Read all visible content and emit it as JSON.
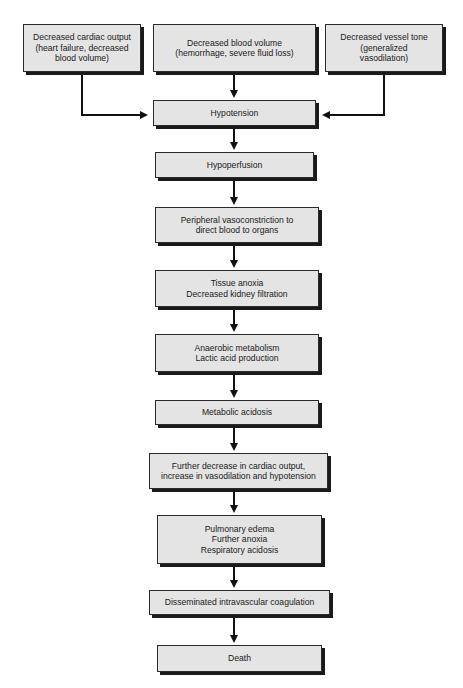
{
  "diagram": {
    "causes": [
      {
        "id": "cause-cardiac",
        "lines": [
          "Decreased cardiac output",
          "(heart failure, decreased",
          "blood volume)"
        ]
      },
      {
        "id": "cause-volume",
        "lines": [
          "Decreased blood volume",
          "(hemorrhage, severe fluid loss)"
        ]
      },
      {
        "id": "cause-tone",
        "lines": [
          "Decreased vessel tone",
          "(generalized",
          "vasodilation)"
        ]
      }
    ],
    "steps": [
      {
        "id": "hypotension",
        "lines": [
          "Hypotension"
        ]
      },
      {
        "id": "hypoperfusion",
        "lines": [
          "Hypoperfusion"
        ]
      },
      {
        "id": "vasoconstriction",
        "lines": [
          "Peripheral vasoconstriction to",
          "direct blood to organs"
        ]
      },
      {
        "id": "tissue-anoxia",
        "lines": [
          "Tissue anoxia",
          "Decreased kidney filtration"
        ]
      },
      {
        "id": "anaerobic",
        "lines": [
          "Anaerobic metabolism",
          "Lactic acid production"
        ]
      },
      {
        "id": "metabolic-acidosis",
        "lines": [
          "Metabolic acidosis"
        ]
      },
      {
        "id": "further-decrease",
        "lines": [
          "Further decrease in cardiac output,",
          "increase in vasodilation and hypotension"
        ]
      },
      {
        "id": "pulmonary",
        "lines": [
          "Pulmonary edema",
          "Further anoxia",
          "Respiratory acidosis"
        ]
      },
      {
        "id": "dic",
        "lines": [
          "Disseminated intravascular coagulation"
        ]
      },
      {
        "id": "death",
        "lines": [
          "Death"
        ]
      }
    ],
    "edges": [
      [
        "cause-cardiac",
        "hypotension"
      ],
      [
        "cause-volume",
        "hypotension"
      ],
      [
        "cause-tone",
        "hypotension"
      ],
      [
        "hypotension",
        "hypoperfusion"
      ],
      [
        "hypoperfusion",
        "vasoconstriction"
      ],
      [
        "vasoconstriction",
        "tissue-anoxia"
      ],
      [
        "tissue-anoxia",
        "anaerobic"
      ],
      [
        "anaerobic",
        "metabolic-acidosis"
      ],
      [
        "metabolic-acidosis",
        "further-decrease"
      ],
      [
        "further-decrease",
        "pulmonary"
      ],
      [
        "pulmonary",
        "dic"
      ],
      [
        "dic",
        "death"
      ]
    ],
    "colors": {
      "box_fill": "#e4e4e4",
      "border": "#2a2a2a",
      "arrow": "#111111"
    }
  }
}
